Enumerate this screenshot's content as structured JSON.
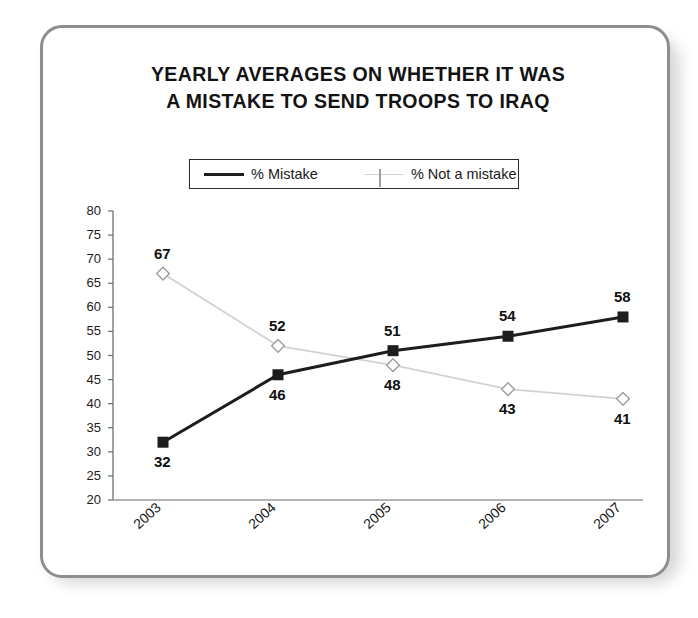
{
  "chart_data": {
    "type": "line",
    "title": "YEARLY AVERAGES ON WHETHER IT WAS A MISTAKE TO SEND TROOPS TO IRAQ",
    "title_line1": "YEARLY AVERAGES ON WHETHER IT WAS",
    "title_line2": "A MISTAKE TO SEND TROOPS TO IRAQ",
    "xlabel": "",
    "ylabel": "",
    "categories": [
      "2003",
      "2004",
      "2005",
      "2006",
      "2007"
    ],
    "series": [
      {
        "name": "% Mistake",
        "values": [
          32,
          46,
          51,
          54,
          58
        ],
        "color": "#1d1d1d",
        "marker": "square",
        "label_position": [
          "below",
          "below",
          "above",
          "above",
          "above"
        ]
      },
      {
        "name": "% Not a mistake",
        "values": [
          67,
          52,
          48,
          43,
          41
        ],
        "color": "#d2d2d2",
        "marker": "diamond",
        "label_position": [
          "above",
          "above",
          "below",
          "below",
          "below"
        ]
      }
    ],
    "ylim": [
      20,
      80
    ],
    "yticks": [
      80,
      75,
      70,
      65,
      60,
      55,
      50,
      45,
      40,
      35,
      30,
      25,
      20
    ],
    "grid": false,
    "legend_position": "top-center",
    "legend_entries": [
      "% Mistake",
      "% Not a mistake"
    ]
  }
}
